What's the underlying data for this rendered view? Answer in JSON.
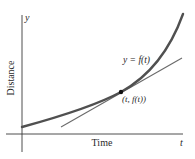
{
  "figure": {
    "type": "diagram",
    "axes": {
      "y_axis_var": "y",
      "x_axis_var": "t",
      "y_label": "Distance",
      "x_label": "Time"
    },
    "curve_label": "y = f(t)",
    "point_label": "(t, f(t))",
    "colors": {
      "curve": "#505050",
      "tangent": "#6a6a6a",
      "axes": "#3a3a3a",
      "point": "#111111",
      "text": "#2a2a2a"
    }
  }
}
